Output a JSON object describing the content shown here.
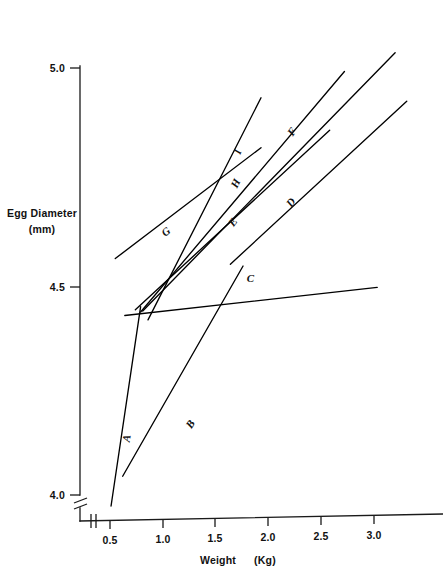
{
  "chart_data": {
    "type": "line",
    "title": "",
    "xlabel": "Weight",
    "xunit": "(Kg)",
    "ylabel": "Egg Diameter",
    "yunit": "(mm)",
    "xlim": [
      0.25,
      3.35
    ],
    "ylim": [
      4.0,
      5.05
    ],
    "xticks": [
      0.5,
      1.0,
      1.5,
      2.0,
      2.5,
      3.0
    ],
    "xtick_labels": [
      "0.5",
      "1.0",
      "1.5",
      "2.0",
      "2.5",
      "3.0"
    ],
    "yticks": [
      4.0,
      4.5,
      5.0
    ],
    "ytick_labels": [
      "4.0",
      "4.5",
      "5.0"
    ],
    "grid": false,
    "legend": "inline-labels",
    "axis_break_y": true,
    "axis_break_x": true,
    "series": [
      {
        "name": "A",
        "label": "A",
        "label_x": 0.69,
        "label_y": 4.153,
        "label_rotation": -80,
        "x": [
          0.51,
          0.79
        ],
        "y": [
          4.0,
          4.455
        ]
      },
      {
        "name": "B",
        "label": "B",
        "label_x": 1.29,
        "label_y": 4.182,
        "label_rotation": -56,
        "x": [
          0.62,
          1.76
        ],
        "y": [
          4.068,
          4.548
        ]
      },
      {
        "name": "C",
        "label": "C",
        "label_x": 1.83,
        "label_y": 4.512,
        "label_rotation": 0,
        "x": [
          0.64,
          3.03
        ],
        "y": [
          4.435,
          4.499
        ]
      },
      {
        "name": "D",
        "label": "D",
        "label_x": 2.24,
        "label_y": 4.688,
        "label_rotation": -52,
        "x": [
          1.64,
          3.31
        ],
        "y": [
          4.552,
          4.924
        ]
      },
      {
        "name": "E",
        "label": "E",
        "label_x": 1.69,
        "label_y": 4.643,
        "label_rotation": -52,
        "x": [
          0.74,
          2.58
        ],
        "y": [
          4.448,
          4.858
        ]
      },
      {
        "name": "F",
        "label": "F",
        "label_x": 2.25,
        "label_y": 4.85,
        "label_rotation": -55,
        "x": [
          0.81,
          3.2
        ],
        "y": [
          4.445,
          5.035
        ]
      },
      {
        "name": "G",
        "label": "G",
        "label_x": 1.05,
        "label_y": 4.62,
        "label_rotation": -38,
        "x": [
          0.55,
          1.93
        ],
        "y": [
          4.565,
          4.818
        ]
      },
      {
        "name": "H",
        "label": "H",
        "label_x": 1.72,
        "label_y": 4.733,
        "label_rotation": -64,
        "x": [
          0.79,
          2.72
        ],
        "y": [
          4.443,
          4.992
        ]
      },
      {
        "name": "I",
        "label": "I",
        "label_x": 1.74,
        "label_y": 4.806,
        "label_rotation": -70,
        "x": [
          0.86,
          1.93
        ],
        "y": [
          4.425,
          4.932
        ]
      }
    ]
  },
  "axes": {
    "y_title_line1": "Egg Diameter",
    "y_title_line2": "(mm)",
    "x_title_main": "Weight",
    "x_title_unit": "(Kg)"
  }
}
